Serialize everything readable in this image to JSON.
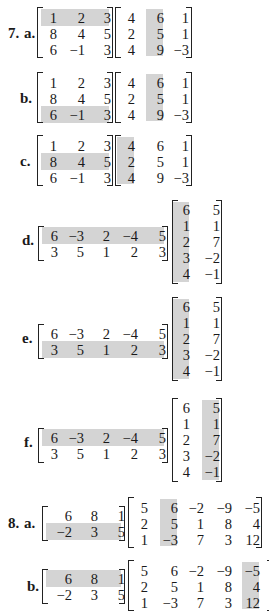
{
  "problems": [
    {
      "number": "7.",
      "parts": [
        {
          "label": "a.",
          "left": {
            "rows": [
              [
                "1",
                "2",
                "3"
              ],
              [
                "8",
                "4",
                "5"
              ],
              [
                "6",
                "−1",
                "3"
              ]
            ],
            "highlight": {
              "type": "row",
              "index": 0
            }
          },
          "right": {
            "rows": [
              [
                "4",
                "6",
                "1"
              ],
              [
                "2",
                "5",
                "1"
              ],
              [
                "4",
                "9",
                "−3"
              ]
            ],
            "highlight": {
              "type": "col",
              "index": 1
            }
          }
        },
        {
          "label": "b.",
          "left": {
            "rows": [
              [
                "1",
                "2",
                "3"
              ],
              [
                "8",
                "4",
                "5"
              ],
              [
                "6",
                "−1",
                "3"
              ]
            ],
            "highlight": {
              "type": "row",
              "index": 2
            }
          },
          "right": {
            "rows": [
              [
                "4",
                "6",
                "1"
              ],
              [
                "2",
                "5",
                "1"
              ],
              [
                "4",
                "9",
                "−3"
              ]
            ],
            "highlight": {
              "type": "col",
              "index": 1
            }
          }
        },
        {
          "label": "c.",
          "left": {
            "rows": [
              [
                "1",
                "2",
                "3"
              ],
              [
                "8",
                "4",
                "5"
              ],
              [
                "6",
                "−1",
                "3"
              ]
            ],
            "highlight": {
              "type": "row",
              "index": 1
            }
          },
          "right": {
            "rows": [
              [
                "4",
                "6",
                "1"
              ],
              [
                "2",
                "5",
                "1"
              ],
              [
                "4",
                "9",
                "−3"
              ]
            ],
            "highlight": {
              "type": "col",
              "index": 0
            }
          }
        },
        {
          "label": "d.",
          "left": {
            "rows": [
              [
                "6",
                "−3",
                "2",
                "−4",
                "5"
              ],
              [
                "3",
                "5",
                "1",
                "2",
                "3"
              ]
            ],
            "highlight": {
              "type": "row",
              "index": 0
            }
          },
          "right": {
            "rows": [
              [
                "6",
                "5"
              ],
              [
                "1",
                "1"
              ],
              [
                "2",
                "7"
              ],
              [
                "3",
                "−2"
              ],
              [
                "4",
                "−1"
              ]
            ],
            "highlight": {
              "type": "col",
              "index": 0
            }
          }
        },
        {
          "label": "e.",
          "left": {
            "rows": [
              [
                "6",
                "−3",
                "2",
                "−4",
                "5"
              ],
              [
                "3",
                "5",
                "1",
                "2",
                "3"
              ]
            ],
            "highlight": {
              "type": "row",
              "index": 1
            }
          },
          "right": {
            "rows": [
              [
                "6",
                "5"
              ],
              [
                "1",
                "1"
              ],
              [
                "2",
                "7"
              ],
              [
                "3",
                "−2"
              ],
              [
                "4",
                "−1"
              ]
            ],
            "highlight": {
              "type": "col",
              "index": 0
            }
          }
        },
        {
          "label": "f.",
          "left": {
            "rows": [
              [
                "6",
                "−3",
                "2",
                "−4",
                "5"
              ],
              [
                "3",
                "5",
                "1",
                "2",
                "3"
              ]
            ],
            "highlight": {
              "type": "row",
              "index": 0
            }
          },
          "right": {
            "rows": [
              [
                "6",
                "5"
              ],
              [
                "1",
                "1"
              ],
              [
                "2",
                "7"
              ],
              [
                "3",
                "−2"
              ],
              [
                "4",
                "−1"
              ]
            ],
            "highlight": {
              "type": "col",
              "index": 1
            }
          }
        }
      ]
    },
    {
      "number": "8.",
      "parts": [
        {
          "label": "a.",
          "left": {
            "rows": [
              [
                "6",
                "8",
                "1"
              ],
              [
                "−2",
                "3",
                "5"
              ]
            ],
            "highlight": {
              "type": "row",
              "index": 1
            }
          },
          "right": {
            "rows": [
              [
                "5",
                "6",
                "−2",
                "−9",
                "−5"
              ],
              [
                "2",
                "5",
                "1",
                "8",
                "4"
              ],
              [
                "1",
                "−3",
                "7",
                "3",
                "12"
              ]
            ],
            "highlight": {
              "type": "col",
              "index": 1
            }
          }
        },
        {
          "label": "b.",
          "left": {
            "rows": [
              [
                "6",
                "8",
                "1"
              ],
              [
                "−2",
                "3",
                "5"
              ]
            ],
            "highlight": {
              "type": "row",
              "index": 0
            }
          },
          "right": {
            "rows": [
              [
                "5",
                "6",
                "−2",
                "−9",
                "−5"
              ],
              [
                "2",
                "5",
                "1",
                "8",
                "4"
              ],
              [
                "1",
                "−3",
                "7",
                "3",
                "12"
              ]
            ],
            "highlight": {
              "type": "col",
              "index": 4
            }
          }
        }
      ]
    }
  ],
  "colors": {
    "highlight": "#d4d4d4",
    "text": "#1a1a1a",
    "background": "#ffffff"
  }
}
